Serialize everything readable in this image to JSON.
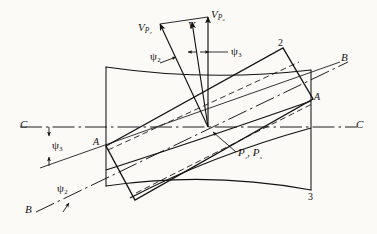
{
  "figure": {
    "type": "engineering-kinematics-diagram",
    "background_color": "#fbfaf7",
    "line_color": "#121212"
  },
  "labels": {
    "v_p2": {
      "base": "V",
      "sub": "P₂"
    },
    "v": {
      "base": "V",
      "sub": ""
    },
    "v_p3": {
      "base": "V",
      "sub": "P₃"
    },
    "psi_2_top": "ψ₂",
    "psi_3_top": "ψ₃",
    "psi_3_left": "ψ₃",
    "psi_2_left": "ψ₂",
    "axis_c_left": "C",
    "axis_c_right": "C",
    "axis_b_left": "B",
    "axis_b_right": "B",
    "corner_a_left": "A",
    "corner_a_right": "A",
    "corner_2": "2",
    "corner_3": "3",
    "point_p": {
      "base": "P",
      "sub2": "₂",
      "sep": ", ",
      "base3": "P",
      "sub3": "₃"
    },
    "point_p_full": "P₂, P₃"
  },
  "vectors": [
    {
      "name": "V_P2",
      "label": "V",
      "subscript": "P₂",
      "angle_from_vertical_deg": -22
    },
    {
      "name": "V",
      "label": "V",
      "subscript": "",
      "angle_from_vertical_deg": -7
    },
    {
      "name": "V_P3",
      "label": "V",
      "subscript": "P₃",
      "angle_from_vertical_deg": 0
    }
  ],
  "angles": {
    "psi_2_deg": 22,
    "psi_3_deg": 7
  },
  "axes": [
    {
      "name": "C-C",
      "style": "dash-dot",
      "orientation": "horizontal",
      "label_left": "C",
      "label_right": "C"
    },
    {
      "name": "B-B",
      "style": "dash-dot",
      "orientation": "inclined",
      "label_left": "B",
      "label_right": "B"
    }
  ],
  "points": [
    {
      "name": "A-left",
      "label": "A"
    },
    {
      "name": "A-right",
      "label": "A"
    },
    {
      "name": "corner-2",
      "label": "2"
    },
    {
      "name": "corner-3",
      "label": "3"
    },
    {
      "name": "P-center",
      "label": "P₂, P₃"
    }
  ]
}
